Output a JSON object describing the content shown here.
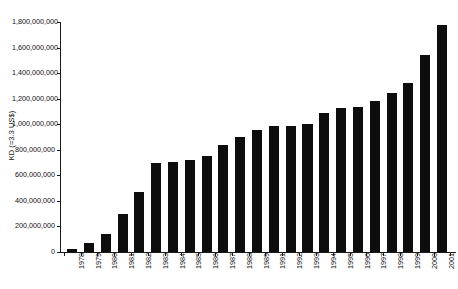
{
  "chart_data": {
    "type": "bar",
    "title": "",
    "subtitle": "",
    "xlabel": "",
    "ylabel": "KD (=3.3 US$)",
    "ylim": [
      0,
      1800000000
    ],
    "ytick_interval": 200000000,
    "ytick_labels": [
      "1,800,000,000",
      "1,600,000,000",
      "1,400,000,000",
      "1,200,000,000",
      "1,000,000,000",
      "800,000,000",
      "600,000,000",
      "400,000,000",
      "200,000,000",
      "0"
    ],
    "ytick_values": [
      1800000000,
      1600000000,
      1400000000,
      1200000000,
      1000000000,
      800000000,
      600000000,
      400000000,
      200000000,
      0
    ],
    "grid": false,
    "legend": null,
    "bar_color": "#0d0d0d",
    "axis_color": "#1a1a1a",
    "categories": [
      "1978",
      "1979",
      "1980",
      "1981",
      "1982",
      "1983",
      "1984",
      "1985",
      "1986",
      "1987",
      "1988",
      "1989",
      "1991",
      "1992",
      "1993",
      "1994",
      "1995",
      "1996",
      "1997",
      "1998",
      "1999",
      "2000",
      "2001"
    ],
    "values": [
      20000000,
      70000000,
      140000000,
      295000000,
      470000000,
      700000000,
      705000000,
      720000000,
      755000000,
      835000000,
      900000000,
      955000000,
      985000000,
      990000000,
      1000000000,
      1085000000,
      1130000000,
      1135000000,
      1180000000,
      1245000000,
      1320000000,
      1545000000,
      1780000000
    ]
  }
}
